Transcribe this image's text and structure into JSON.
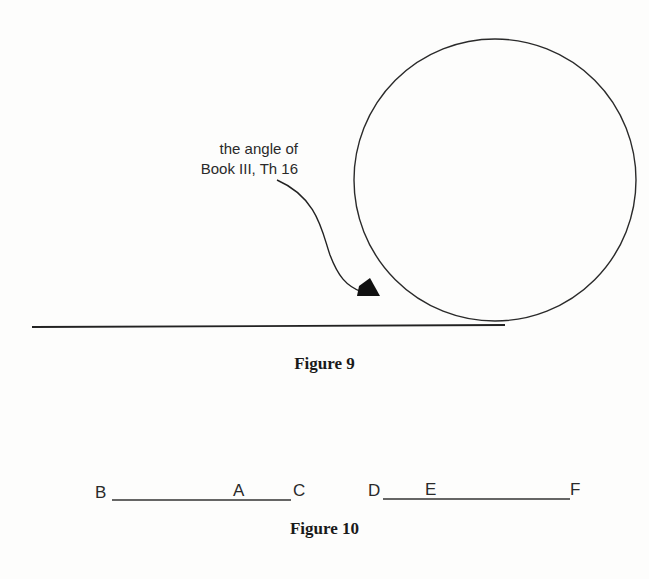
{
  "figure9": {
    "annotation_line1": "the angle of",
    "annotation_line2": "Book III, Th 16",
    "caption": "Figure 9",
    "shapes": {
      "circle": {
        "cx": 495,
        "cy": 180,
        "r": 141
      },
      "tangent_line": {
        "x1": 32,
        "y1": 327,
        "x2": 505,
        "y2": 325
      },
      "arrow_color": "#111111"
    }
  },
  "figure10": {
    "caption": "Figure 10",
    "segment1": {
      "start_label": "B",
      "mid_label": "A",
      "end_label": "C"
    },
    "segment2": {
      "start_label": "D",
      "mid_label": "E",
      "end_label": "F"
    }
  },
  "colors": {
    "ink": "#1a1a1a",
    "paper": "#fdfdfc"
  }
}
